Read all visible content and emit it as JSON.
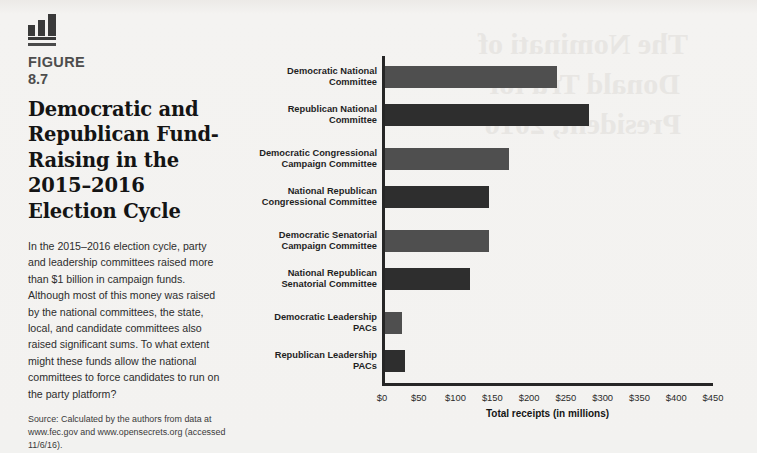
{
  "figure": {
    "icon": "bar-chart-icon",
    "label": "FIGURE",
    "number": "8.7",
    "title": "Democratic and Republican Fund-Raising in the 2015–2016 Election Cycle",
    "body": "In the 2015–2016 election cycle, party and leadership committees raised more than $1 billion in campaign funds. Although most of this money was raised by the national committees, the state, local, and candidate committees also raised significant sums. To what extent might these funds allow the national committees to force candidates to run on the party platform?",
    "source": "Source: Calculated by the authors from data at www.fec.gov and www.opensecrets.org (accessed 11/6/16)."
  },
  "background_bleed": "The Nominati of Donald Tru for President, 2016",
  "chart_data": {
    "type": "bar",
    "orientation": "horizontal",
    "title": "Democratic and Republican Fund-Raising in the 2015–2016 Election Cycle",
    "xlabel": "Total receipts (in millions)",
    "ylabel": "",
    "xlim": [
      0,
      450
    ],
    "grid": false,
    "legend": "none",
    "tick_labels": [
      "$0",
      "$50",
      "$100",
      "$150",
      "$200",
      "$250",
      "$300",
      "$350",
      "$400",
      "$450"
    ],
    "tick_values": [
      0,
      50,
      100,
      150,
      200,
      250,
      300,
      350,
      400,
      450
    ],
    "categories": [
      "Democratic National\nCommittee",
      "Republican National\nCommittee",
      "Democratic Congressional\nCampaign Committee",
      "National Republican\nCongressional Committee",
      "Democratic Senatorial\nCampaign Committee",
      "National Republican\nSenatorial Committee",
      "Democratic Leadership\nPACs",
      "Republican Leadership\nPACs"
    ],
    "values": [
      234,
      278,
      169,
      141,
      141,
      116,
      23,
      27
    ],
    "party": [
      "dem",
      "rep",
      "dem",
      "rep",
      "dem",
      "rep",
      "dem",
      "rep"
    ],
    "colors": {
      "democratic": "#4f4f4f",
      "republican": "#2e2e2e",
      "axis": "#262626",
      "background": "#f3f2f0"
    }
  }
}
